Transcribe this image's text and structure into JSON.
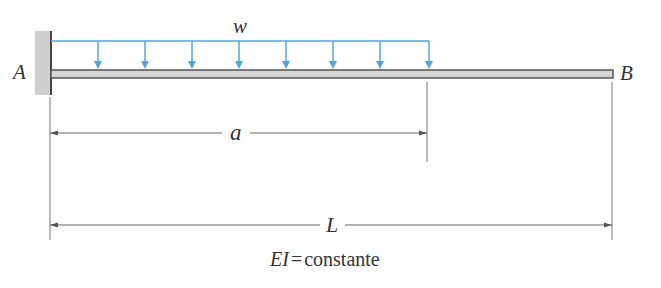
{
  "diagram": {
    "type": "cantilever-beam-partial-uniform-load",
    "labels": {
      "fixed_end": "A",
      "free_end": "B",
      "load": "w",
      "load_length": "a",
      "beam_length": "L"
    },
    "caption": {
      "symbol": "EI",
      "equals": "=",
      "text": "constante"
    },
    "colors": {
      "load": "#4aa8e0",
      "beam": "#555555",
      "wall": "#c8c8c8",
      "text": "#333333"
    },
    "load_arrow_count": 8
  }
}
